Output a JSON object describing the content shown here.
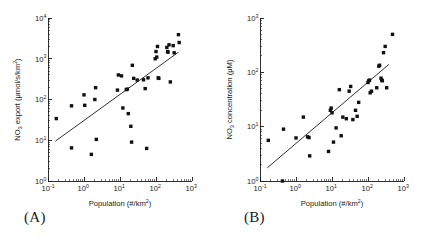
{
  "figure": {
    "panels": [
      {
        "id": "A",
        "label": "(A)",
        "xlabel_main": "Population (#/km",
        "xlabel_sup": "2",
        "xlabel_tail": ")",
        "ylabel_prefix": "NO",
        "ylabel_sub": "3",
        "ylabel_main": " export (",
        "ylabel_units": "μmol/s/km",
        "ylabel_units_sup": "2",
        "ylabel_tail": ")"
      },
      {
        "id": "B",
        "label": "(B)",
        "xlabel_main": "Population (#/km",
        "xlabel_sup": "2",
        "xlabel_tail": ")",
        "ylabel_prefix": "NO",
        "ylabel_sub": "3",
        "ylabel_main": " concentration (",
        "ylabel_units": "μM",
        "ylabel_units_sup": "",
        "ylabel_tail": ")"
      }
    ]
  },
  "chart_data": [
    {
      "type": "scatter",
      "panel": "A",
      "title": "",
      "xlabel": "Population (#/km2)",
      "ylabel": "NO3 export (μmol/s/km2)",
      "xscale": "log",
      "yscale": "log",
      "xlim": [
        0.1,
        1000
      ],
      "ylim": [
        1,
        10000
      ],
      "xticks": [
        0.1,
        1,
        10,
        100,
        1000
      ],
      "xtick_labels": [
        "10-1",
        "100",
        "101",
        "102",
        "103"
      ],
      "yticks": [
        1,
        10,
        100,
        1000,
        10000
      ],
      "ytick_labels": [
        "100",
        "101",
        "102",
        "103",
        "104"
      ],
      "grid": false,
      "legend": "none",
      "marker": "square",
      "marker_color": "#111111",
      "points": [
        [
          0.17,
          34
        ],
        [
          0.45,
          70
        ],
        [
          0.45,
          6.5
        ],
        [
          1.0,
          130
        ],
        [
          1.05,
          72
        ],
        [
          1.6,
          4.5
        ],
        [
          2.0,
          100
        ],
        [
          2.1,
          195
        ],
        [
          2.2,
          10.5
        ],
        [
          8.5,
          170
        ],
        [
          9.0,
          400
        ],
        [
          11.0,
          380
        ],
        [
          12.0,
          62
        ],
        [
          15.0,
          175
        ],
        [
          16.0,
          180
        ],
        [
          17.0,
          45
        ],
        [
          20.0,
          22
        ],
        [
          21.0,
          9.0
        ],
        [
          22.0,
          690
        ],
        [
          24.0,
          330
        ],
        [
          30.0,
          300
        ],
        [
          45.0,
          305
        ],
        [
          50.0,
          185
        ],
        [
          55.0,
          6.3
        ],
        [
          60.0,
          340
        ],
        [
          95.0,
          1000
        ],
        [
          100.0,
          1500
        ],
        [
          105.0,
          1100
        ],
        [
          110.0,
          2000
        ],
        [
          115.0,
          340
        ],
        [
          120.0,
          330
        ],
        [
          200.0,
          1900
        ],
        [
          210.0,
          1500
        ],
        [
          215.0,
          1450
        ],
        [
          230.0,
          2200
        ],
        [
          250.0,
          270
        ],
        [
          300.0,
          2100
        ],
        [
          320.0,
          1400
        ],
        [
          420.0,
          3900
        ],
        [
          440.0,
          2500
        ]
      ],
      "fit_line": {
        "x": [
          0.16,
          420
        ],
        "y": [
          9.5,
          1450
        ]
      }
    },
    {
      "type": "scatter",
      "panel": "B",
      "title": "",
      "xlabel": "Population (#/km2)",
      "ylabel": "NO3 concentration (μM)",
      "xscale": "log",
      "yscale": "log",
      "xlim": [
        0.1,
        1000
      ],
      "ylim": [
        1,
        1000
      ],
      "xticks": [
        0.1,
        1,
        10,
        100,
        1000
      ],
      "xtick_labels": [
        "10-1",
        "100",
        "101",
        "102",
        "103"
      ],
      "yticks": [
        1,
        10,
        100,
        1000
      ],
      "ytick_labels": [
        "100",
        "101",
        "102",
        "103"
      ],
      "grid": false,
      "legend": "none",
      "marker": "square",
      "marker_color": "#111111",
      "points": [
        [
          0.17,
          5.6
        ],
        [
          0.42,
          1.0
        ],
        [
          0.45,
          9.0
        ],
        [
          1.0,
          6.2
        ],
        [
          1.6,
          15.0
        ],
        [
          2.1,
          6.5
        ],
        [
          2.3,
          6.3
        ],
        [
          2.4,
          2.9
        ],
        [
          8.0,
          3.5
        ],
        [
          9.0,
          20.0
        ],
        [
          9.5,
          22.0
        ],
        [
          10.0,
          18.0
        ],
        [
          11.0,
          5.2
        ],
        [
          13.0,
          9.5
        ],
        [
          16.0,
          48.0
        ],
        [
          18.0,
          6.8
        ],
        [
          20.0,
          15.0
        ],
        [
          25.0,
          14.0
        ],
        [
          30.0,
          45.0
        ],
        [
          33.0,
          55.0
        ],
        [
          38.0,
          13.5
        ],
        [
          45.0,
          20.0
        ],
        [
          50.0,
          15.5
        ],
        [
          55.0,
          28.0
        ],
        [
          100.0,
          65.0
        ],
        [
          105.0,
          70.0
        ],
        [
          110.0,
          72.0
        ],
        [
          115.0,
          42.0
        ],
        [
          125.0,
          45.0
        ],
        [
          175.0,
          52.0
        ],
        [
          200.0,
          130.0
        ],
        [
          210.0,
          135.0
        ],
        [
          230.0,
          78.0
        ],
        [
          240.0,
          72.0
        ],
        [
          250.0,
          70.0
        ],
        [
          270.0,
          230.0
        ],
        [
          300.0,
          300.0
        ],
        [
          330.0,
          52.0
        ],
        [
          480.0,
          500.0
        ]
      ],
      "fit_line": {
        "x": [
          0.16,
          380
        ],
        "y": [
          1.75,
          140
        ]
      }
    }
  ]
}
